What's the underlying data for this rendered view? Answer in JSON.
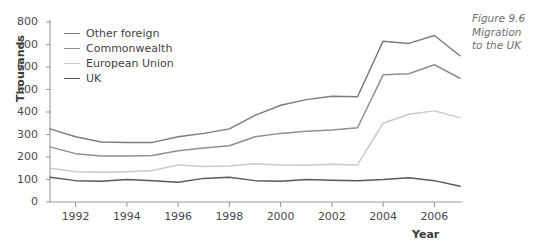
{
  "caption": {
    "line1": "Figure 9.6",
    "line2": "Migration",
    "line3": "to the UK"
  },
  "chart_data": {
    "type": "line",
    "title": "Figure 9.6 Migration to the UK",
    "xlabel": "Year",
    "ylabel": "Thousands",
    "xlim": [
      1991,
      2007
    ],
    "ylim": [
      0,
      800
    ],
    "ytick_step": 100,
    "yticks": [
      0,
      100,
      200,
      300,
      400,
      500,
      600,
      700,
      800
    ],
    "xticks": [
      1992,
      1994,
      1996,
      1998,
      2000,
      2002,
      2004,
      2006
    ],
    "xtick_labels": [
      "1992",
      "1994",
      "1996",
      "1998",
      "2000",
      "2002",
      "2004",
      "2006"
    ],
    "ytick_labels": [
      "0",
      "100",
      "200",
      "300",
      "400",
      "500",
      "600",
      "700",
      "800"
    ],
    "x": [
      1991,
      1992,
      1993,
      1994,
      1995,
      1996,
      1997,
      1998,
      1999,
      2000,
      2001,
      2002,
      2003,
      2004,
      2005,
      2006,
      2007
    ],
    "grid": false,
    "legend_position": "upper left",
    "series": [
      {
        "name": "Other foreign",
        "color": "#7c7c7c",
        "values": [
          325,
          290,
          267,
          265,
          265,
          290,
          305,
          325,
          385,
          430,
          455,
          470,
          468,
          715,
          705,
          740,
          650
        ]
      },
      {
        "name": "Commonwealth",
        "color": "#8f8f8f",
        "values": [
          245,
          215,
          205,
          205,
          207,
          228,
          240,
          250,
          290,
          305,
          315,
          320,
          330,
          565,
          570,
          610,
          550
        ]
      },
      {
        "name": "European Union",
        "color": "#c9c9c9",
        "values": [
          150,
          135,
          132,
          135,
          140,
          165,
          158,
          160,
          170,
          165,
          163,
          168,
          165,
          350,
          390,
          405,
          375
        ]
      },
      {
        "name": "UK",
        "color": "#595959",
        "values": [
          110,
          95,
          92,
          100,
          95,
          88,
          105,
          110,
          95,
          92,
          100,
          97,
          95,
          100,
          108,
          95,
          70
        ]
      }
    ]
  },
  "legend": {
    "items": [
      {
        "label": "Other foreign",
        "color": "#7c7c7c"
      },
      {
        "label": "Commonwealth",
        "color": "#8f8f8f"
      },
      {
        "label": "European Union",
        "color": "#c9c9c9"
      },
      {
        "label": "UK",
        "color": "#595959"
      }
    ]
  },
  "axis": {
    "color": "#9a9a9a"
  }
}
